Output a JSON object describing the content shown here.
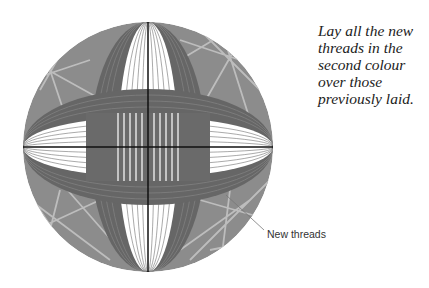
{
  "caption": "Lay all the new threads in the second colour over those previously laid.",
  "callout_label": "New threads",
  "colors": {
    "sphere_base": "#8c8c8c",
    "random_threads": "#bdbdbd",
    "band_dark": "#666666",
    "band_line": "#8a8a8a",
    "gap_white": "#ffffff",
    "axis_line": "#111111"
  }
}
